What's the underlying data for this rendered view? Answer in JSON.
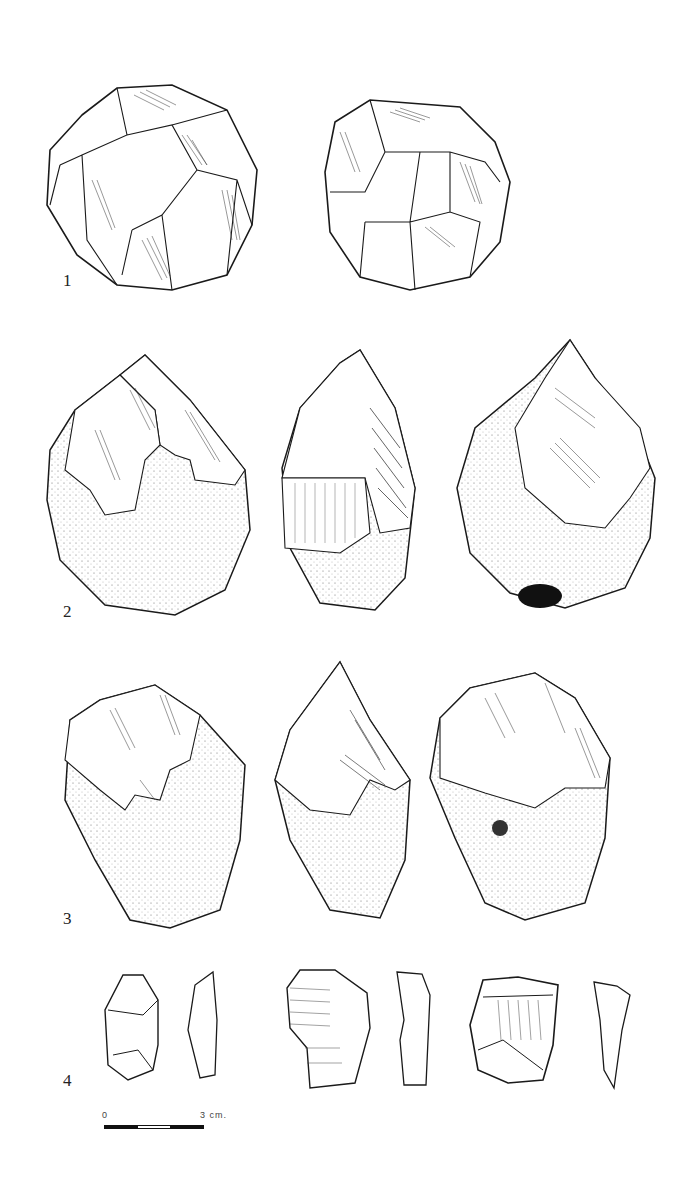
{
  "plate": {
    "figures": [
      {
        "number": "1",
        "label": "1",
        "description": "discoidal core, two faces",
        "views": 2
      },
      {
        "number": "2",
        "label": "2",
        "description": "cortical pebble tool / core, three views",
        "views": 3
      },
      {
        "number": "3",
        "label": "3",
        "description": "cortical pebble tool / core, three views",
        "views": 3
      },
      {
        "number": "4",
        "label": "4",
        "description": "three retouched flakes with profile sections",
        "views": 6
      }
    ],
    "scale_bar": {
      "start_label": "0",
      "end_label": "3 cm.",
      "segments": [
        "black",
        "white",
        "black"
      ]
    }
  },
  "colors": {
    "ink": "#1a1a1a",
    "paper": "#ffffff",
    "cortex_stipple": "#555555"
  }
}
